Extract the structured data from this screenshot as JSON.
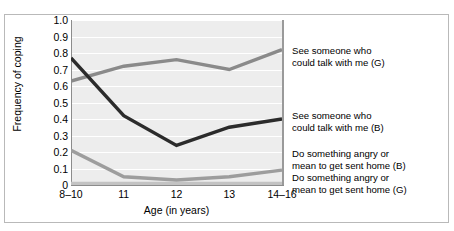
{
  "chart_data": {
    "type": "line",
    "title": "",
    "xlabel": "Age (in years)",
    "ylabel": "Frequency of coping",
    "categories": [
      "8–10",
      "11",
      "12",
      "13",
      "14–16"
    ],
    "ylim": [
      0,
      1.0
    ],
    "yticks": [
      "1.0",
      "0.9",
      "0.8",
      "0.7",
      "0.6",
      "0.5",
      "0.4",
      "0.3",
      "0.2",
      "0.1",
      "0"
    ],
    "ytick_values": [
      1.0,
      0.9,
      0.8,
      0.7,
      0.6,
      0.5,
      0.4,
      0.3,
      0.2,
      0.1,
      0
    ],
    "grid": true,
    "grid_orientation": "horizontal",
    "legend_position": "right-inline",
    "plot_background": "#ededed",
    "series": [
      {
        "name": "See someone who\ncould talk with me (G)",
        "short": "see-someone-G",
        "color": "#8a8a8a",
        "values": [
          0.63,
          0.72,
          0.76,
          0.7,
          0.82
        ]
      },
      {
        "name": "See someone who\ncould talk with me (B)",
        "short": "see-someone-B",
        "color": "#2b2b2b",
        "values": [
          0.77,
          0.42,
          0.24,
          0.35,
          0.4
        ]
      },
      {
        "name": "Do something angry or\nmean to get sent home (B)",
        "short": "angry-mean-B",
        "color": "#9d9d9d",
        "values": [
          0.21,
          0.05,
          0.03,
          0.05,
          0.09
        ]
      },
      {
        "name": "Do something angry or\nmean to get sent home (G)",
        "short": "angry-mean-G",
        "color": "#c3c3c3",
        "values": [
          0.01,
          0.01,
          0.01,
          0.01,
          0.01
        ]
      }
    ]
  },
  "axes": {
    "ylabel": "Frequency of coping",
    "xlabel": "Age (in years)"
  }
}
